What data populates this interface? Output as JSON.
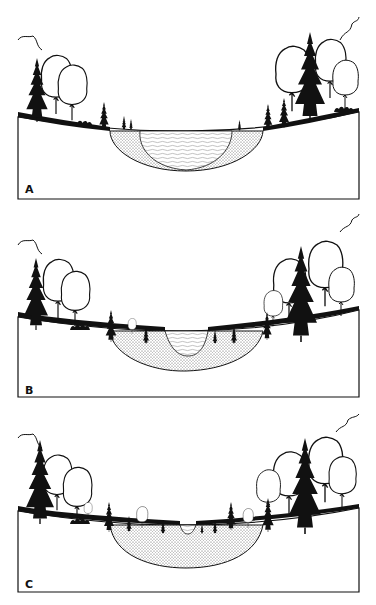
{
  "figure": {
    "colors": {
      "ink": "#111111",
      "background": "#ffffff",
      "sediment_dot": "#555555",
      "water_line": "#8a8a8a"
    },
    "panels": [
      {
        "id": "A",
        "label": "A",
        "stage": "open-water lake, shallow sediment along margins"
      },
      {
        "id": "B",
        "label": "B",
        "stage": "lake largely filled with sediment, small central pond"
      },
      {
        "id": "C",
        "label": "C",
        "stage": "basin nearly filled, vegetation encroaching to center"
      }
    ]
  }
}
